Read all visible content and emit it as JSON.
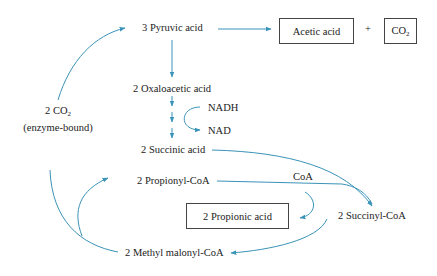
{
  "diagram": {
    "arrow_color": "#3a93b8",
    "nodes": {
      "pyruvic": "3 Pyruvic acid",
      "acetic": "Acetic acid",
      "plus": "+",
      "co2_box": "CO",
      "co2_box_sub": "2",
      "oxaloacetic": "2 Oxaloacetic acid",
      "nadh": "NADH",
      "nad": "NAD",
      "succinic": "2 Succinic acid",
      "propionyl": "2 Propionyl-CoA",
      "coa": "CoA",
      "propionic": "2 Propionic acid",
      "succinyl": "2 Succinyl-CoA",
      "methylmalonyl": "2 Methyl malonyl-CoA",
      "co2_enzyme": "2 CO",
      "co2_enzyme_sub": "2",
      "enzyme_bound": "(enzyme-bound)"
    },
    "edges": [
      {
        "from": "pyruvic",
        "to": "acetic"
      },
      {
        "from": "pyruvic",
        "to": "oxaloacetic"
      },
      {
        "from": "oxaloacetic",
        "to": "succinic",
        "cofactor": "NADH → NAD"
      },
      {
        "from": "succinic",
        "to": "succinyl"
      },
      {
        "from": "propionyl",
        "to": "succinyl",
        "note": "CoA transfer"
      },
      {
        "from": "coa",
        "to": "propionic"
      },
      {
        "from": "succinyl",
        "to": "methylmalonyl"
      },
      {
        "from": "methylmalonyl",
        "to": "propionyl"
      },
      {
        "from": "methylmalonyl",
        "to": "pyruvic",
        "via": "2 CO2 (enzyme-bound)"
      }
    ]
  }
}
